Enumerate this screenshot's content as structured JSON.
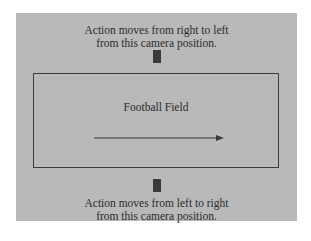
{
  "diagram": {
    "background_color": "#b9b9b9",
    "top_caption": {
      "line1": "Action moves from right to left",
      "line2": "from this camera position."
    },
    "bottom_caption": {
      "line1": "Action moves from left to right",
      "line2": "from this camera position."
    },
    "field": {
      "label": "Football Field",
      "arrow_direction": "left-to-right"
    },
    "cameras": [
      {
        "position": "top",
        "icon": "camera-icon"
      },
      {
        "position": "bottom",
        "icon": "camera-icon"
      }
    ]
  }
}
